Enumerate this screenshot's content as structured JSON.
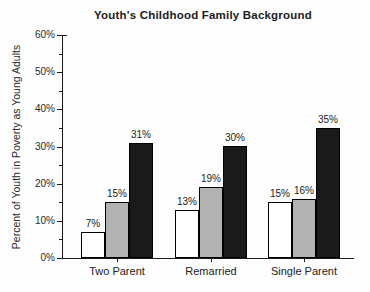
{
  "chart_data": {
    "type": "bar",
    "title": "Youth's Childhood Family Background",
    "ylabel": "Percent of Youth in Poverty as Young Adults",
    "xlabel": "",
    "categories": [
      "Two Parent",
      "Remarried",
      "Single Parent"
    ],
    "series": [
      {
        "name": "white-bar-series",
        "color": "#ffffff",
        "values": [
          7,
          13,
          15
        ]
      },
      {
        "name": "gray-bar-series",
        "color": "#b2b2b2",
        "values": [
          15,
          19,
          16
        ]
      },
      {
        "name": "black-bar-series",
        "color": "#1a1a1a",
        "values": [
          31,
          30,
          35
        ]
      }
    ],
    "value_labels": [
      [
        "7%",
        "13%",
        "15%"
      ],
      [
        "15%",
        "19%",
        "16%"
      ],
      [
        "31%",
        "30%",
        "35%"
      ]
    ],
    "ylim": [
      0,
      60
    ],
    "ytick_step": 10,
    "yminor_step": 5,
    "ytick_labels": [
      "0%",
      "10%",
      "20%",
      "30%",
      "40%",
      "50%",
      "60%"
    ],
    "grid": false,
    "legend": "none",
    "axis_color": "#1a1a1a"
  }
}
